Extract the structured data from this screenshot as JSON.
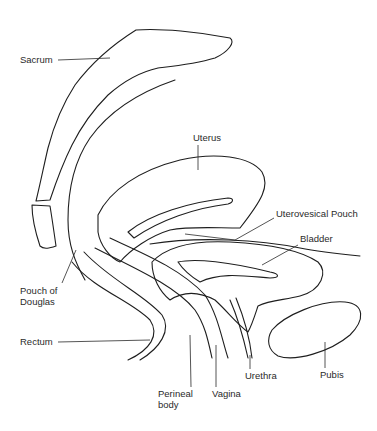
{
  "diagram": {
    "type": "anatomical sagittal section (female pelvis)",
    "colors": {
      "background": "#ffffff",
      "line": "#1e1e1e",
      "stipple": "#8a8a8a",
      "hatch": "#4a4a4a"
    },
    "labels": {
      "sacrum": "Sacrum",
      "uterus": "Uterus",
      "uterovesical_pouch": "Uterovesical Pouch",
      "bladder": "Bladder",
      "pouch_of_douglas_1": "Pouch of",
      "pouch_of_douglas_2": "Douglas",
      "rectum": "Rectum",
      "perineal_body_1": "Perineal",
      "perineal_body_2": "body",
      "vagina": "Vagina",
      "urethra": "Urethra",
      "pubis": "Pubis"
    }
  }
}
